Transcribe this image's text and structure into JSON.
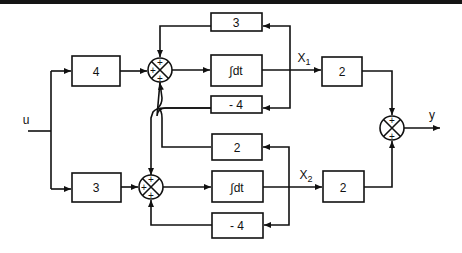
{
  "diagram": {
    "type": "block-diagram",
    "input_label": "u",
    "output_label": "y",
    "state_labels": {
      "x1": "X",
      "x1_sub": "1",
      "x2": "X",
      "x2_sub": "2"
    },
    "blocks": {
      "gain_u_top": "4",
      "gain_u_bottom": "3",
      "fb_top_upper": "3",
      "integrator_top": "∫dt",
      "fb_top_lower": "- 4",
      "fb_bottom_upper": "2",
      "integrator_bottom": "∫dt",
      "fb_bottom_lower": "- 4",
      "out_gain_x1": "2",
      "out_gain_x2": "2"
    },
    "sum_signs": "+",
    "colors": {
      "ink": "#111111",
      "background": "#ffffff",
      "top_band": "#151515"
    }
  }
}
